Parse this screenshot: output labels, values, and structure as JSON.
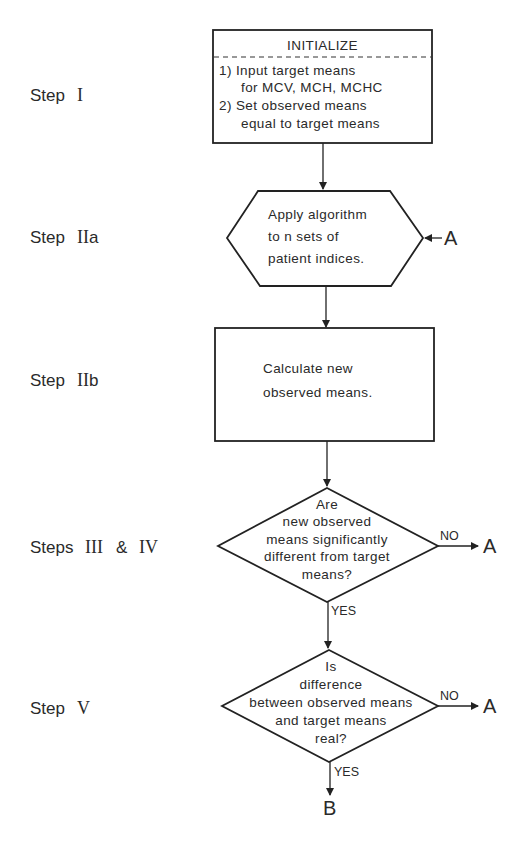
{
  "steps": {
    "step1": {
      "prefix": "Step",
      "numeral": "I"
    },
    "step2a": {
      "prefix": "Step",
      "numeral": "II",
      "suffix": "a"
    },
    "step2b": {
      "prefix": "Step",
      "numeral": "II",
      "suffix": "b"
    },
    "step34": {
      "prefix": "Steps",
      "numeral1": "III",
      "amp": "&",
      "numeral2": "IV"
    },
    "step5": {
      "prefix": "Step",
      "numeral": "V"
    }
  },
  "initialize": {
    "title": "INITIALIZE",
    "lines": [
      "1) Input target means",
      "for MCV, MCH, MCHC",
      "2) Set observed means",
      "equal to target means"
    ]
  },
  "hexagon": {
    "lines": [
      "Apply algorithm",
      "to n sets of",
      "patient indices."
    ],
    "connector": "A"
  },
  "calculate": {
    "lines": [
      "Calculate new",
      "observed means."
    ]
  },
  "decision1": {
    "lines": [
      "Are",
      "new observed",
      "means significantly",
      "different from target",
      "means?"
    ],
    "no_label": "NO",
    "no_target": "A",
    "yes_label": "YES"
  },
  "decision2": {
    "lines": [
      "Is",
      "difference",
      "between observed means",
      "and target means",
      "real?"
    ],
    "no_label": "NO",
    "no_target": "A",
    "yes_label": "YES",
    "yes_target": "B"
  }
}
